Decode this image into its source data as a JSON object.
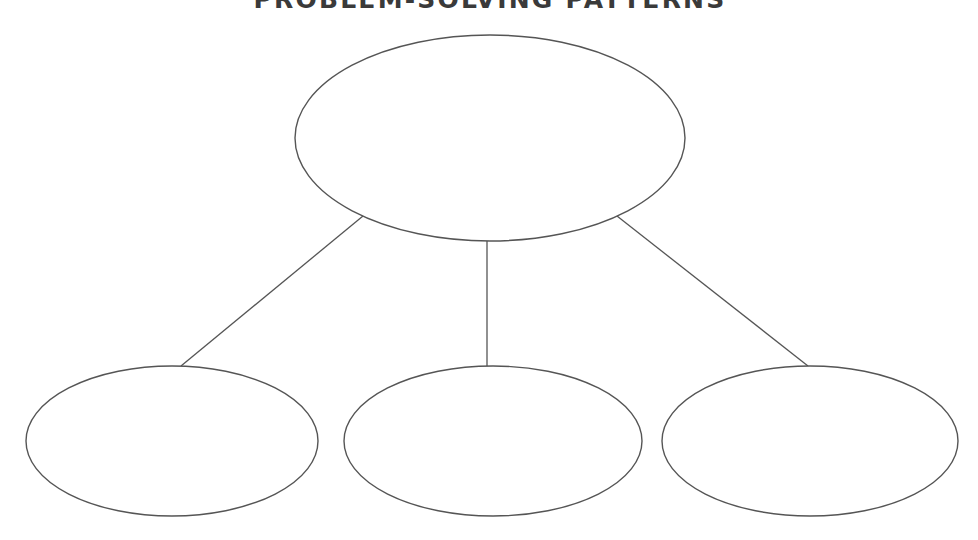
{
  "title": "PROBLEM-SOLVING PATTERNS",
  "colors": {
    "background": "#ffffff",
    "stroke": "#555555",
    "title": "#3a3a3a"
  },
  "diagram": {
    "type": "tree-graphic-organizer",
    "root": {
      "label": "",
      "cx": 490,
      "cy": 138,
      "rx": 195,
      "ry": 103
    },
    "children": [
      {
        "label": "",
        "cx": 172,
        "cy": 441,
        "rx": 146,
        "ry": 75
      },
      {
        "label": "",
        "cx": 493,
        "cy": 441,
        "rx": 149,
        "ry": 75
      },
      {
        "label": "",
        "cx": 810,
        "cy": 441,
        "rx": 148,
        "ry": 75
      }
    ],
    "connectors": [
      {
        "x1": 363,
        "y1": 216,
        "x2": 181,
        "y2": 366
      },
      {
        "x1": 487,
        "y1": 241,
        "x2": 487,
        "y2": 366
      },
      {
        "x1": 617,
        "y1": 216,
        "x2": 808,
        "y2": 366
      }
    ]
  }
}
